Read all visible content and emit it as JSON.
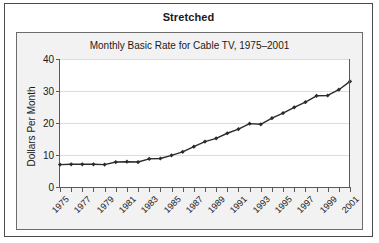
{
  "figure": {
    "caption": "Stretched"
  },
  "chart_data": {
    "type": "line",
    "title": "Monthly Basic Rate for Cable TV, 1975–2001",
    "xlabel": "",
    "ylabel": "Dollars Per Month",
    "xlim": [
      1975,
      2001
    ],
    "ylim": [
      0,
      40
    ],
    "grid": true,
    "legend": null,
    "y_ticks": [
      40,
      30,
      20,
      10,
      0
    ],
    "y_tick_labels": [
      "40",
      "30",
      "20",
      "10",
      "0"
    ],
    "x_ticks": [
      1975,
      1976,
      1977,
      1978,
      1979,
      1980,
      1981,
      1982,
      1983,
      1984,
      1985,
      1986,
      1987,
      1988,
      1989,
      1990,
      1991,
      1992,
      1993,
      1994,
      1995,
      1996,
      1997,
      1998,
      1999,
      2000,
      2001
    ],
    "x_tick_labels": [
      "1975",
      "",
      "1977",
      "",
      "1979",
      "",
      "1981",
      "",
      "1983",
      "",
      "1985",
      "",
      "1987",
      "",
      "1989",
      "",
      "1991",
      "",
      "1993",
      "",
      "1995",
      "",
      "1997",
      "",
      "1999",
      "",
      "2001"
    ],
    "x": [
      1975,
      1976,
      1977,
      1978,
      1979,
      1980,
      1981,
      1982,
      1983,
      1984,
      1985,
      1986,
      1987,
      1988,
      1989,
      1990,
      1991,
      1992,
      1993,
      1994,
      1995,
      1996,
      1997,
      1998,
      1999,
      2000,
      2001
    ],
    "values": [
      7.0,
      7.1,
      7.1,
      7.1,
      7.0,
      7.8,
      7.9,
      7.8,
      8.8,
      8.9,
      9.9,
      11.0,
      12.6,
      14.2,
      15.2,
      16.8,
      18.1,
      19.8,
      19.6,
      21.5,
      23.1,
      24.9,
      26.5,
      28.5,
      28.6,
      30.4,
      33.0
    ],
    "series_name": "Monthly Basic Rate",
    "marker": "diamond",
    "line_color": "#2b2b2b",
    "marker_color": "#2b2b2b",
    "grid_color": "#dcdcdc",
    "plot_bg": "#ffffff",
    "panel_bg": "#f2f2f2"
  }
}
